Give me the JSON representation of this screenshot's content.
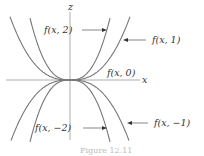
{
  "diagram": {
    "axes": {
      "vertical_label": "z",
      "horizontal_label": "x"
    },
    "curves": [
      {
        "id": "f-x-2",
        "label": "f(x, 2)",
        "c": 2
      },
      {
        "id": "f-x-1",
        "label": "f(x, 1)",
        "c": 1
      },
      {
        "id": "f-x-0",
        "label": "f(x, 0)",
        "c": 0
      },
      {
        "id": "f-x-neg1",
        "label": "f(x, −1)",
        "c": -1
      },
      {
        "id": "f-x-neg2",
        "label": "f(x, −2)",
        "c": -2
      }
    ],
    "caption": "Figure 12.11"
  }
}
